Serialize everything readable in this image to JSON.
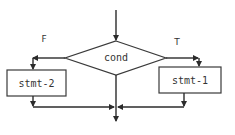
{
  "diagram": {
    "type": "flowchart-if-else",
    "decision": {
      "label": "cond"
    },
    "branches": {
      "false": {
        "label": "F",
        "statement": "stmt-2"
      },
      "true": {
        "label": "T",
        "statement": "stmt-1"
      }
    },
    "colors": {
      "stroke": "#2b2b2b",
      "fill": "#ffffff",
      "text": "#333333"
    }
  }
}
